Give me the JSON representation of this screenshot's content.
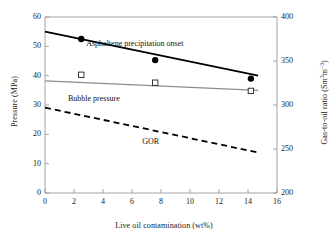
{
  "chart_data": {
    "type": "line",
    "title": "",
    "xlabel": "Live oil contamination (wt%)",
    "ylabel": "Pressure (MPa)",
    "y2label_text": "Gas-to-oil ratio (Sm3m-3)",
    "y2label_prefix": "Gas-to-oil ratio (Sm",
    "y2label_sup1": "3",
    "y2label_mid": "m",
    "y2label_sup2": "−3",
    "y2label_suffix": ")",
    "xlim": [
      0,
      16
    ],
    "ylim": [
      0,
      60
    ],
    "y2lim": [
      200,
      400
    ],
    "xticks": [
      0,
      2,
      4,
      6,
      8,
      10,
      12,
      14,
      16
    ],
    "yticks": [
      0,
      10,
      20,
      30,
      40,
      50,
      60
    ],
    "y2ticks": [
      200,
      250,
      300,
      350,
      400
    ],
    "grid": false,
    "legend_position": "inline-annotations",
    "series": [
      {
        "name": "Asphaltene precipitation onset",
        "axis": "left",
        "style": "solid",
        "color": "#000000",
        "linewidth": 1.8,
        "marker": "filled-circle",
        "trend_x": [
          0,
          14.7
        ],
        "trend_y": [
          55.0,
          40.0
        ],
        "points_x": [
          2.5,
          7.6,
          14.2
        ],
        "points_y": [
          52.5,
          45.3,
          39.0
        ]
      },
      {
        "name": "Bubble pressure",
        "axis": "left",
        "style": "solid",
        "color": "#8c8c8c",
        "linewidth": 1.2,
        "marker": "open-square",
        "trend_x": [
          0,
          14.7
        ],
        "trend_y": [
          38.2,
          35.0
        ],
        "points_x": [
          2.5,
          7.6,
          14.2
        ],
        "points_y": [
          40.3,
          37.6,
          34.8
        ]
      },
      {
        "name": "GOR",
        "axis": "right",
        "style": "dashed",
        "color": "#000000",
        "linewidth": 1.8,
        "marker": "none",
        "trend_x": [
          0,
          14.7
        ],
        "trend_y_left_equiv": [
          29.2,
          13.7
        ],
        "trend_y2": [
          297,
          246
        ]
      }
    ],
    "annotations": [
      {
        "text": "Asphaltene precipitation onset",
        "x": 5.6,
        "y": 50.5
      },
      {
        "text": "Bubble pressure",
        "x": 3.1,
        "y": 31.8
      },
      {
        "text": "GOR",
        "x": 7.4,
        "y": 17.0
      }
    ]
  },
  "axes": {
    "x": {
      "label": "Live oil contamination (wt%)",
      "ticks": [
        "0",
        "2",
        "4",
        "6",
        "8",
        "10",
        "12",
        "14",
        "16"
      ]
    },
    "y_left": {
      "label": "Pressure (MPa)",
      "ticks": [
        "0",
        "10",
        "20",
        "30",
        "40",
        "50",
        "60"
      ]
    },
    "y_right": {
      "ticks": [
        "200",
        "250",
        "300",
        "350",
        "400"
      ]
    }
  },
  "labels": {
    "asphaltene": "Asphaltene precipitation onset",
    "bubble": "Bubble pressure",
    "gor": "GOR"
  },
  "colors": {
    "axis": "#9a9a9a",
    "asphaltene_line": "#000000",
    "bubble_line": "#8c8c8c",
    "gor_line": "#000000",
    "text": "#1a1a1a",
    "background": "#ffffff"
  }
}
